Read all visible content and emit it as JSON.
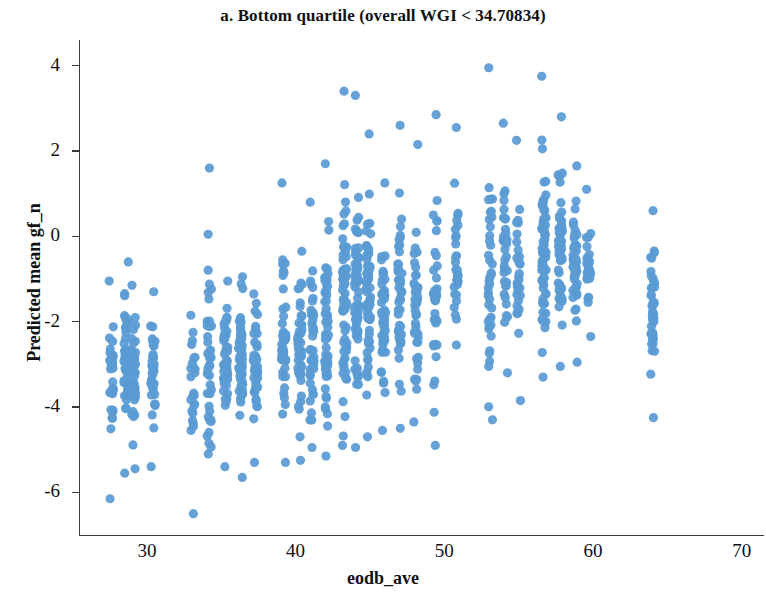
{
  "figure": {
    "title": "a. Bottom quartile (overall WGI < 34.70834)",
    "panel_letter": "a",
    "background_color": "#ffffff",
    "marker_color": "#5a9bd4",
    "axis_color": "#3a3a3a"
  },
  "chart_data": {
    "type": "scatter",
    "title": "a. Bottom quartile (overall WGI < 34.70834)",
    "xlabel": "eodb_ave",
    "ylabel": "Predicted mean gf_n",
    "xlim": [
      25.5,
      71.5
    ],
    "ylim": [
      -7.0,
      4.6
    ],
    "xticks": [
      30,
      40,
      50,
      60,
      70
    ],
    "xticklabels": [
      "30",
      "40",
      "50",
      "60",
      "70"
    ],
    "yticks": [
      4,
      2,
      0,
      -2,
      -4,
      -6
    ],
    "yticklabels": [
      "4",
      "2",
      "0",
      "-2",
      "-4",
      "-6"
    ],
    "grid": false,
    "legend": null,
    "marker": {
      "shape": "circle",
      "color": "#5a9bd4",
      "size_px": 9,
      "opacity": 0.95
    },
    "columns": [
      {
        "x": 27.6,
        "n": 34,
        "y_min": -6.15,
        "y_max": -1.05,
        "y_mean": -3.35
      },
      {
        "x": 28.6,
        "n": 52,
        "y_min": -5.55,
        "y_max": -0.6,
        "y_mean": -3.0
      },
      {
        "x": 29.1,
        "n": 46,
        "y_min": -5.45,
        "y_max": -1.15,
        "y_mean": -3.1
      },
      {
        "x": 30.4,
        "n": 38,
        "y_min": -5.4,
        "y_max": -1.3,
        "y_mean": -3.25
      },
      {
        "x": 33.1,
        "n": 26,
        "y_min": -6.5,
        "y_max": -1.85,
        "y_mean": -3.5
      },
      {
        "x": 34.2,
        "n": 42,
        "y_min": -5.1,
        "y_max": 1.6,
        "y_mean": -2.75
      },
      {
        "x": 35.3,
        "n": 48,
        "y_min": -5.4,
        "y_max": -1.05,
        "y_mean": -2.9
      },
      {
        "x": 36.3,
        "n": 54,
        "y_min": -5.65,
        "y_max": -0.95,
        "y_mean": -2.85
      },
      {
        "x": 37.3,
        "n": 44,
        "y_min": -5.3,
        "y_max": -1.35,
        "y_mean": -2.95
      },
      {
        "x": 39.2,
        "n": 50,
        "y_min": -5.3,
        "y_max": 1.25,
        "y_mean": -2.55
      },
      {
        "x": 40.3,
        "n": 46,
        "y_min": -5.25,
        "y_max": -0.35,
        "y_mean": -2.6
      },
      {
        "x": 41.1,
        "n": 40,
        "y_min": -4.95,
        "y_max": 0.8,
        "y_mean": -2.45
      },
      {
        "x": 42.1,
        "n": 56,
        "y_min": -5.15,
        "y_max": 1.7,
        "y_mean": -2.15
      },
      {
        "x": 43.3,
        "n": 66,
        "y_min": -4.9,
        "y_max": 3.4,
        "y_mean": -1.6
      },
      {
        "x": 44.1,
        "n": 72,
        "y_min": -4.95,
        "y_max": 3.3,
        "y_mean": -1.55
      },
      {
        "x": 44.9,
        "n": 64,
        "y_min": -4.7,
        "y_max": 2.4,
        "y_mean": -1.45
      },
      {
        "x": 45.9,
        "n": 50,
        "y_min": -4.55,
        "y_max": 1.25,
        "y_mean": -1.85
      },
      {
        "x": 47.0,
        "n": 46,
        "y_min": -4.5,
        "y_max": 2.6,
        "y_mean": -1.5
      },
      {
        "x": 48.1,
        "n": 44,
        "y_min": -4.35,
        "y_max": 2.15,
        "y_mean": -1.6
      },
      {
        "x": 49.4,
        "n": 36,
        "y_min": -4.9,
        "y_max": 2.85,
        "y_mean": -1.45
      },
      {
        "x": 50.8,
        "n": 30,
        "y_min": -2.55,
        "y_max": 2.55,
        "y_mean": -0.75
      },
      {
        "x": 53.1,
        "n": 40,
        "y_min": -4.3,
        "y_max": 3.95,
        "y_mean": -1.1
      },
      {
        "x": 54.1,
        "n": 34,
        "y_min": -3.2,
        "y_max": 2.65,
        "y_mean": -0.55
      },
      {
        "x": 55.0,
        "n": 30,
        "y_min": -3.85,
        "y_max": 2.25,
        "y_mean": -0.7
      },
      {
        "x": 56.7,
        "n": 70,
        "y_min": -3.3,
        "y_max": 3.75,
        "y_mean": -0.25
      },
      {
        "x": 57.8,
        "n": 58,
        "y_min": -3.05,
        "y_max": 2.8,
        "y_mean": -0.35
      },
      {
        "x": 58.8,
        "n": 50,
        "y_min": -2.95,
        "y_max": 1.65,
        "y_mean": -0.55
      },
      {
        "x": 59.7,
        "n": 26,
        "y_min": -2.35,
        "y_max": 1.1,
        "y_mean": -0.7
      },
      {
        "x": 64.0,
        "n": 44,
        "y_min": -4.25,
        "y_max": 0.6,
        "y_mean": -1.7
      }
    ]
  }
}
